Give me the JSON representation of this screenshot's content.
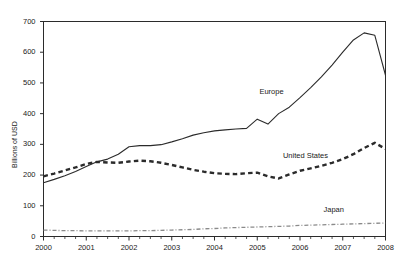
{
  "chart_data": {
    "type": "line",
    "title": "",
    "xlabel": "",
    "ylabel": "Billions of USD",
    "xlim": [
      2000,
      2008
    ],
    "ylim": [
      0,
      700
    ],
    "yticks": [
      0,
      100,
      200,
      300,
      400,
      500,
      600,
      700
    ],
    "xticks": [
      2000,
      2001,
      2002,
      2003,
      2004,
      2005,
      2006,
      2007,
      2008
    ],
    "xtick_labels": [
      "2000",
      "2001",
      "2002",
      "2003",
      "2004",
      "2005",
      "2006",
      "2007",
      "2008"
    ],
    "ytick_labels": [
      "0",
      "100",
      "200",
      "300",
      "400",
      "500",
      "600",
      "700"
    ],
    "minor_xticks_per_year": 4,
    "grid": false,
    "legend": "inline-annotations",
    "x": [
      2000.0,
      2000.25,
      2000.5,
      2000.75,
      2001.0,
      2001.25,
      2001.5,
      2001.75,
      2002.0,
      2002.25,
      2002.5,
      2002.75,
      2003.0,
      2003.25,
      2003.5,
      2003.75,
      2004.0,
      2004.25,
      2004.5,
      2004.75,
      2005.0,
      2005.25,
      2005.5,
      2005.75,
      2006.0,
      2006.25,
      2006.5,
      2006.75,
      2007.0,
      2007.25,
      2007.5,
      2007.75,
      2008.0
    ],
    "series": [
      {
        "name": "Europe",
        "style": "solid",
        "color": "#2b2b2b",
        "width": 1.1,
        "label_x": 2005.05,
        "label_y": 470,
        "values": [
          175,
          186,
          198,
          212,
          228,
          243,
          252,
          268,
          292,
          296,
          296,
          299,
          308,
          318,
          330,
          338,
          344,
          347,
          350,
          352,
          382,
          366,
          400,
          421,
          452,
          485,
          520,
          558,
          600,
          640,
          663,
          655,
          525
        ]
      },
      {
        "name": "United States",
        "style": "dashed",
        "color": "#2b2b2b",
        "width": 2.4,
        "label_x": 2005.6,
        "label_y": 262,
        "values": [
          196,
          205,
          215,
          225,
          236,
          243,
          241,
          240,
          244,
          247,
          245,
          240,
          233,
          225,
          217,
          211,
          206,
          204,
          203,
          206,
          208,
          196,
          189,
          202,
          214,
          222,
          230,
          240,
          252,
          268,
          288,
          305,
          285
        ]
      },
      {
        "name": "Japan",
        "style": "dash-dot",
        "color": "#8a8a8a",
        "width": 1.3,
        "label_x": 2006.55,
        "label_y": 86,
        "values": [
          21,
          20,
          19,
          19,
          18,
          18,
          18,
          18,
          18,
          19,
          19,
          20,
          21,
          22,
          23,
          25,
          26,
          28,
          29,
          30,
          31,
          32,
          33,
          34,
          36,
          37,
          38,
          39,
          40,
          41,
          42,
          43,
          44
        ]
      }
    ]
  },
  "axes": {
    "frame_color": "#2b2b2b",
    "tick_color": "#2b2b2b",
    "background": "#ffffff"
  }
}
